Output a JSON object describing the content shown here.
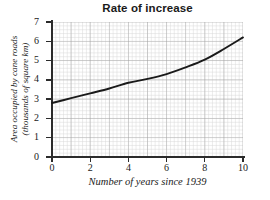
{
  "chart_data": {
    "type": "line",
    "title": "Rate of increase",
    "xlabel": "Number of years since 1939",
    "ylabel_line1": "Area occupied by cane roads",
    "ylabel_line2": "(thousands of square km)",
    "ylabel": "Area occupied by cane roads (thousands of square km)",
    "xlim": [
      0,
      10
    ],
    "ylim": [
      0,
      7
    ],
    "xticks": [
      0,
      2,
      4,
      6,
      8,
      10
    ],
    "yticks": [
      0,
      1,
      2,
      3,
      4,
      5,
      6,
      7
    ],
    "xtick_labels": [
      "0",
      "2",
      "4",
      "6",
      "8",
      "10"
    ],
    "ytick_labels": [
      "0",
      "1",
      "2",
      "3",
      "4",
      "5",
      "6",
      "7"
    ],
    "grid": true,
    "grid_minor": true,
    "grid_minor_subdivisions": 5,
    "legend": "none",
    "series": [
      {
        "name": "Area occupied by cane roads",
        "color": "#1a1a1a",
        "x": [
          0,
          1,
          2,
          3,
          4,
          5,
          6,
          7,
          8,
          9,
          10
        ],
        "values": [
          2.8,
          3.05,
          3.3,
          3.55,
          3.85,
          4.05,
          4.3,
          4.65,
          5.05,
          5.6,
          6.2
        ]
      }
    ],
    "colors": {
      "curve": "#1a1a1a",
      "axis": "#2b2b2b",
      "grid_major": "#9a9a9a",
      "grid_minor": "#d8d8d8",
      "background": "#ffffff",
      "text": "#1a1a1a"
    }
  }
}
